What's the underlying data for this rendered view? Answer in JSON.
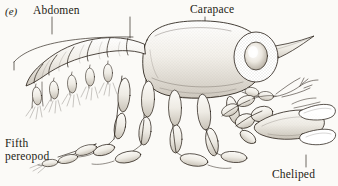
{
  "figure": {
    "panel_id": "(e)",
    "background_color": "#fbfaf7",
    "ink_color": "#241c14"
  },
  "labels": {
    "abdomen": "Abdomen",
    "carapace": "Carapace",
    "fifth_pereopod_line1": "Fifth",
    "fifth_pereopod_line2": "pereopod",
    "cheliped": "Cheliped"
  },
  "anatomy": {
    "parts": [
      "abdomen",
      "carapace",
      "eye",
      "rostrum",
      "antenna",
      "pereopods",
      "fifth-pereopod",
      "cheliped",
      "pleopods"
    ]
  }
}
